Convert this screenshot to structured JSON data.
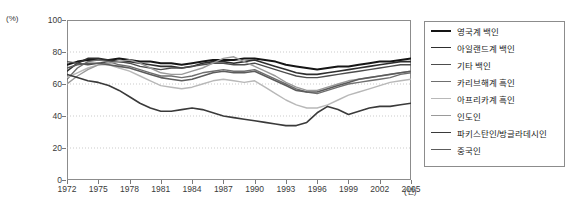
{
  "chart_data": {
    "type": "line",
    "title": "",
    "xlabel": "년",
    "ylabel": "(%)",
    "unit_label": "(%)",
    "year_unit_label": "(년)",
    "xlim": [
      1972,
      2005
    ],
    "ylim": [
      0,
      100
    ],
    "ytick_labels": [
      "100",
      "80",
      "60",
      "40",
      "20",
      "0"
    ],
    "ytick_values": [
      100,
      80,
      60,
      40,
      20,
      0
    ],
    "xtick_labels": [
      "1972",
      "1975",
      "1978",
      "1981",
      "1984",
      "1987",
      "1990",
      "1993",
      "1996",
      "1999",
      "2002",
      "2005"
    ],
    "xtick_values": [
      1972,
      1975,
      1978,
      1981,
      1984,
      1987,
      1990,
      1993,
      1996,
      1999,
      2002,
      2005
    ],
    "grid": "horizontal-dotted",
    "legend_position": "right-outside",
    "x": [
      1972,
      1973,
      1974,
      1975,
      1976,
      1977,
      1978,
      1979,
      1980,
      1981,
      1982,
      1983,
      1984,
      1985,
      1986,
      1987,
      1988,
      1989,
      1990,
      1991,
      1992,
      1993,
      1994,
      1995,
      1996,
      1997,
      1998,
      1999,
      2000,
      2001,
      2002,
      2003,
      2004,
      2005
    ],
    "series": [
      {
        "name": "영국계 백인",
        "color": "#151515",
        "width": 2.0,
        "values": [
          72,
          74,
          75,
          75,
          75,
          76,
          75,
          74,
          74,
          73,
          73,
          72,
          73,
          74,
          75,
          75,
          75,
          76,
          76,
          75,
          74,
          72,
          71,
          70,
          69,
          70,
          71,
          71,
          72,
          73,
          74,
          74,
          75,
          76
        ]
      },
      {
        "name": "아일랜드계 백인",
        "color": "#2e2e2e",
        "width": 1.6,
        "values": [
          68,
          73,
          76,
          76,
          75,
          74,
          74,
          73,
          72,
          71,
          71,
          70,
          71,
          73,
          74,
          74,
          73,
          74,
          75,
          73,
          71,
          69,
          67,
          66,
          66,
          67,
          68,
          69,
          70,
          71,
          72,
          73,
          74,
          74
        ]
      },
      {
        "name": "기타 백인",
        "color": "#4d4d4d",
        "width": 1.4,
        "values": [
          74,
          73,
          72,
          73,
          74,
          74,
          73,
          71,
          70,
          69,
          70,
          70,
          71,
          72,
          73,
          73,
          72,
          72,
          73,
          71,
          69,
          67,
          65,
          64,
          64,
          65,
          66,
          67,
          68,
          69,
          70,
          71,
          72,
          72
        ]
      },
      {
        "name": "카리브해계 흑인",
        "color": "#6f6f6f",
        "width": 1.4,
        "values": [
          63,
          70,
          74,
          75,
          74,
          72,
          71,
          69,
          67,
          65,
          65,
          64,
          65,
          67,
          68,
          69,
          68,
          68,
          69,
          66,
          63,
          60,
          57,
          55,
          54,
          56,
          58,
          60,
          61,
          62,
          63,
          64,
          66,
          67
        ]
      },
      {
        "name": "아프리카계 흑인",
        "color": "#b8b8b8",
        "width": 1.4,
        "values": [
          64,
          67,
          70,
          72,
          72,
          70,
          68,
          65,
          62,
          59,
          58,
          57,
          58,
          60,
          62,
          63,
          62,
          61,
          62,
          58,
          54,
          50,
          47,
          45,
          45,
          47,
          50,
          53,
          55,
          57,
          59,
          61,
          62,
          63
        ]
      },
      {
        "name": "인도인",
        "color": "#9a9a9a",
        "width": 1.4,
        "values": [
          60,
          65,
          69,
          72,
          73,
          74,
          75,
          73,
          70,
          67,
          66,
          66,
          68,
          70,
          73,
          76,
          77,
          74,
          71,
          68,
          65,
          61,
          58,
          56,
          56,
          58,
          60,
          62,
          63,
          64,
          65,
          66,
          67,
          68
        ]
      },
      {
        "name": "파키스탄인/방글라데시인",
        "color": "#3a3a3a",
        "width": 1.6,
        "values": [
          66,
          64,
          62,
          61,
          59,
          56,
          52,
          48,
          45,
          43,
          43,
          44,
          45,
          44,
          42,
          40,
          39,
          38,
          37,
          36,
          35,
          34,
          34,
          36,
          42,
          46,
          44,
          41,
          43,
          45,
          46,
          46,
          47,
          48
        ]
      },
      {
        "name": "중국인",
        "color": "#5c5c5c",
        "width": 1.6,
        "values": [
          70,
          72,
          73,
          73,
          72,
          71,
          70,
          68,
          66,
          64,
          63,
          62,
          63,
          65,
          67,
          68,
          67,
          67,
          68,
          65,
          62,
          59,
          56,
          55,
          55,
          57,
          59,
          61,
          63,
          64,
          65,
          66,
          67,
          68
        ]
      }
    ]
  },
  "legend": {
    "items": [
      {
        "label": "영국계 백인"
      },
      {
        "label": "아일랜드계 백인"
      },
      {
        "label": "기타 백인"
      },
      {
        "label": "카리브해계 흑인"
      },
      {
        "label": "아프리카계 흑인"
      },
      {
        "label": "인도인"
      },
      {
        "label": "파키스탄인/방글라데시인"
      },
      {
        "label": "중국인"
      }
    ]
  }
}
